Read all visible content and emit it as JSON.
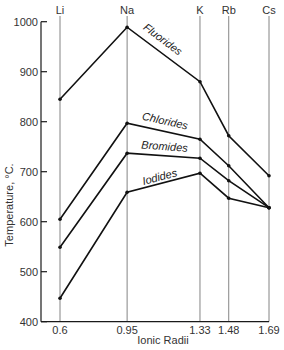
{
  "chart_data": {
    "type": "line",
    "title": "",
    "xlabel": "Ionic Radii",
    "ylabel": "Temperature, °C.",
    "ylim": [
      400,
      1000
    ],
    "yticks": [
      400,
      500,
      600,
      700,
      800,
      900,
      1000
    ],
    "grid": "vertical lines at each cation",
    "legend": "inline labels on lines",
    "categories": [
      "Li",
      "Na",
      "K",
      "Rb",
      "Cs"
    ],
    "x": [
      0.6,
      0.95,
      1.33,
      1.48,
      1.69
    ],
    "x_tick_labels": [
      "0.6",
      "0.95",
      "1.33",
      "1.48",
      "1.69"
    ],
    "series": [
      {
        "name": "Fluorides",
        "values": [
          845,
          989,
          880,
          772,
          692
        ]
      },
      {
        "name": "Chlorides",
        "values": [
          605,
          797,
          765,
          712,
          628
        ]
      },
      {
        "name": "Bromides",
        "values": [
          549,
          737,
          727,
          682,
          628
        ]
      },
      {
        "name": "Iodides",
        "values": [
          447,
          659,
          697,
          647,
          628
        ]
      }
    ]
  }
}
